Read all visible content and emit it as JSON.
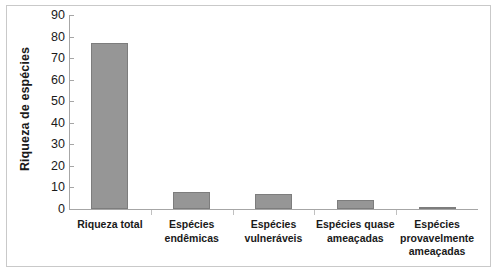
{
  "chart_data": {
    "type": "bar",
    "title": "",
    "xlabel": "",
    "ylabel": "Riqueza de espécies",
    "categories": [
      "Riqueza total",
      "Espécies endêmicas",
      "Espécies vulneráveis",
      "Espécies quase ameaçadas",
      "Espécies provavelmente ameaçadas"
    ],
    "values": [
      77,
      8,
      7,
      4,
      1
    ],
    "ylim": [
      0,
      90
    ],
    "yticks": [
      0,
      10,
      20,
      30,
      40,
      50,
      60,
      70,
      80,
      90
    ],
    "ytick_labels": [
      "0",
      "10",
      "20",
      "30",
      "40",
      "50",
      "60",
      "70",
      "80",
      "90"
    ],
    "grid": false,
    "legend": false,
    "legend_position": "none",
    "series": [
      {
        "name": "Riqueza de espécies",
        "values": [
          77,
          8,
          7,
          4,
          1
        ]
      }
    ],
    "colors": {
      "bar_fill": "#969696",
      "bar_border": "#7d7d7d",
      "axis": "#a6a6a6",
      "text": "#1a1a1a",
      "frame": "#c9c9c9",
      "background": "#ffffff"
    }
  }
}
